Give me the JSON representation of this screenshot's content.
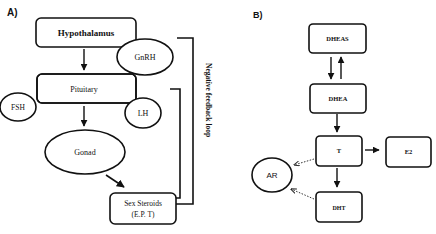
{
  "panel_a": {
    "label": "A)",
    "nodes": {
      "hypothalamus": "Hypothalamus",
      "gnrh": "GnRH",
      "pituitary": "Pituitary",
      "fsh": "FSH",
      "lh": "LH",
      "gonad": "Gonad",
      "sex_steroids_line1": "Sex Steroids",
      "sex_steroids_line2": "(E.P. T)"
    },
    "feedback_label": "Negative feedback loop"
  },
  "panel_b": {
    "label": "B)",
    "nodes": {
      "dheas": "DHEAS",
      "dhea": "DHEA",
      "t": "T",
      "e2": "E2",
      "dht": "DHT",
      "ar": "AR"
    }
  },
  "colors": {
    "stroke": "#111111",
    "text": "#111111",
    "background": "#ffffff"
  }
}
